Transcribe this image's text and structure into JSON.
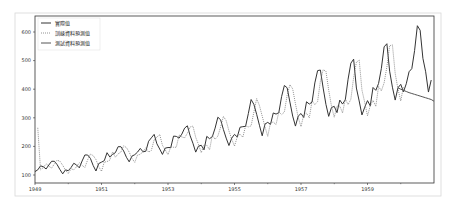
{
  "chart_data": {
    "type": "line",
    "title": "",
    "xlabel": "",
    "ylabel": "",
    "xlim": [
      1949.0,
      1961.0
    ],
    "ylim": [
      85,
      650
    ],
    "grid": false,
    "legend_position": "upper left",
    "x_ticks": [
      "1949",
      "1951",
      "1953",
      "1955",
      "1957",
      "1959"
    ],
    "y_ticks": [
      100,
      200,
      300,
      400,
      500,
      600
    ],
    "legend": [
      "實際值",
      "訓練資料預測值",
      "測試資料預測值"
    ],
    "x_start": 1949.0,
    "x_step": 0.08333,
    "series": [
      {
        "name": "實際值",
        "style": "solid",
        "color": "#333333",
        "values": [
          112,
          118,
          132,
          129,
          121,
          135,
          148,
          148,
          136,
          119,
          104,
          118,
          115,
          126,
          141,
          135,
          125,
          149,
          170,
          170,
          158,
          133,
          114,
          140,
          145,
          150,
          178,
          163,
          172,
          178,
          199,
          199,
          184,
          162,
          146,
          166,
          171,
          180,
          193,
          181,
          183,
          218,
          230,
          242,
          209,
          191,
          172,
          194,
          196,
          196,
          236,
          235,
          229,
          243,
          264,
          272,
          237,
          211,
          180,
          201,
          204,
          188,
          235,
          227,
          234,
          264,
          302,
          293,
          259,
          229,
          203,
          229,
          242,
          233,
          267,
          269,
          270,
          315,
          364,
          347,
          312,
          274,
          237,
          278,
          284,
          277,
          317,
          313,
          318,
          374,
          413,
          405,
          355,
          306,
          271,
          306,
          315,
          301,
          356,
          348,
          355,
          422,
          465,
          467,
          404,
          347,
          305,
          336,
          340,
          318,
          362,
          348,
          363,
          435,
          491,
          505,
          404,
          359,
          310,
          337,
          360,
          342,
          406,
          396,
          420,
          472,
          548,
          559,
          463,
          407,
          362,
          405,
          417,
          391,
          419,
          461,
          472,
          535,
          622,
          606,
          508,
          461,
          390,
          432
        ]
      },
      {
        "name": "訓練資料預測值",
        "style": "dotted",
        "color": "#777777",
        "start_index": 1,
        "values": [
          265,
          118,
          126,
          139,
          131,
          124,
          139,
          152,
          148,
          134,
          117,
          105,
          122,
          118,
          129,
          143,
          134,
          126,
          153,
          173,
          168,
          154,
          129,
          113,
          145,
          147,
          152,
          181,
          162,
          174,
          180,
          202,
          196,
          180,
          158,
          144,
          170,
          172,
          182,
          195,
          180,
          186,
          223,
          232,
          242,
          204,
          188,
          171,
          198,
          197,
          197,
          240,
          233,
          230,
          246,
          268,
          271,
          232,
          207,
          178,
          205,
          204,
          188,
          239,
          225,
          236,
          268,
          305,
          290,
          254,
          225,
          201,
          233,
          243,
          232,
          271,
          268,
          272,
          320,
          367,
          343,
          306,
          269,
          235,
          283,
          285,
          276,
          321,
          311,
          320,
          379,
          416,
          401,
          349,
          301,
          269,
          311,
          316,
          300,
          360,
          346,
          357,
          428,
          468,
          463,
          397,
          341,
          302,
          341,
          341,
          317,
          366,
          346,
          365,
          441,
          494,
          502,
          397,
          354,
          307,
          342,
          361,
          340,
          410,
          394,
          422,
          478,
          552,
          555,
          455,
          401,
          359,
          410
        ]
      },
      {
        "name": "測試資料預測值",
        "style": "solid",
        "color": "#555555",
        "start_index": 131,
        "values": [
          405,
          400,
          396,
          392,
          388,
          385,
          382,
          379,
          376,
          373,
          370,
          367,
          364,
          358
        ]
      }
    ]
  }
}
